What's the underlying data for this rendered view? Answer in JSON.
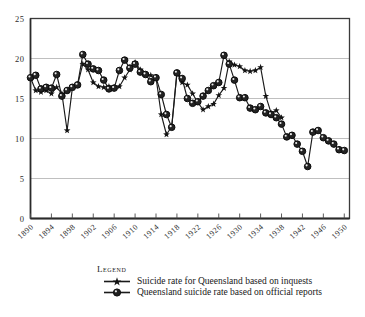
{
  "chart_data": {
    "type": "line",
    "title": "",
    "subtitle": "",
    "xlabel": "",
    "ylabel": "",
    "xlim": [
      1890,
      1951
    ],
    "ylim": [
      0,
      25
    ],
    "yticks": [
      0,
      5,
      10,
      15,
      20,
      25
    ],
    "ytick_labels": [
      "0",
      "5",
      "10",
      "15",
      "20",
      "25"
    ],
    "grid": "horizontal",
    "legend_position": "below-axes",
    "legend_title": "Legend",
    "x": [
      1890,
      1891,
      1892,
      1893,
      1894,
      1895,
      1896,
      1897,
      1898,
      1899,
      1900,
      1901,
      1902,
      1903,
      1904,
      1905,
      1906,
      1907,
      1908,
      1909,
      1910,
      1911,
      1912,
      1913,
      1914,
      1915,
      1916,
      1917,
      1918,
      1919,
      1920,
      1921,
      1922,
      1923,
      1924,
      1925,
      1926,
      1927,
      1928,
      1929,
      1930,
      1931,
      1932,
      1933,
      1934,
      1935,
      1936,
      1937,
      1938,
      1939,
      1940,
      1941,
      1942,
      1943,
      1944,
      1945,
      1946,
      1947,
      1948,
      1949,
      1950
    ],
    "xtick_labels": [
      "1890",
      "1894",
      "1898",
      "1902",
      "1906",
      "1910",
      "1914",
      "1918",
      "1922",
      "1926",
      "1930",
      "1934",
      "1938",
      "1942",
      "1946",
      "1950"
    ],
    "xtick_values": [
      1890,
      1894,
      1898,
      1902,
      1906,
      1910,
      1914,
      1918,
      1922,
      1926,
      1930,
      1934,
      1938,
      1942,
      1946,
      1950
    ],
    "series": [
      {
        "name": "Suicide rate for Queensland based on inquests",
        "marker": "star",
        "color": "#1a1a1a",
        "values": [
          17.6,
          16.0,
          15.8,
          16.0,
          15.6,
          16.4,
          15.6,
          11.0,
          16.3,
          16.7,
          19.3,
          18.6,
          17.0,
          16.5,
          16.4,
          16.5,
          16.4,
          16.5,
          17.6,
          18.6,
          19.5,
          18.6,
          18.0,
          17.9,
          17.6,
          13.0,
          10.5,
          11.5,
          18.2,
          17.0,
          16.7,
          15.6,
          14.5,
          13.6,
          14.0,
          14.3,
          15.4,
          16.3,
          19.6,
          19.2,
          19.0,
          18.5,
          18.4,
          18.5,
          18.9,
          15.3,
          13.2,
          13.5,
          12.6,
          null,
          null,
          null,
          null,
          null,
          null,
          null,
          null,
          null,
          null,
          null,
          null
        ]
      },
      {
        "name": "Queensland suicide rate based on official reports",
        "marker": "circle",
        "color": "#1a1a1a",
        "values": [
          17.6,
          17.9,
          16.2,
          16.4,
          16.3,
          18.0,
          15.3,
          16.0,
          16.4,
          16.7,
          20.5,
          19.3,
          18.7,
          18.5,
          17.3,
          16.2,
          16.3,
          18.5,
          19.8,
          18.8,
          19.3,
          18.3,
          18.0,
          17.1,
          17.6,
          15.5,
          13.0,
          11.4,
          18.2,
          17.5,
          15.0,
          14.4,
          14.6,
          15.3,
          16.0,
          16.6,
          17.0,
          20.4,
          19.3,
          17.3,
          15.1,
          15.1,
          13.8,
          13.6,
          14.0,
          13.2,
          13.0,
          12.6,
          11.8,
          10.2,
          10.4,
          9.3,
          8.4,
          6.5,
          10.8,
          11.0,
          10.1,
          9.7,
          9.3,
          8.6,
          8.5
        ]
      }
    ]
  },
  "legend": {
    "title": "Legend",
    "entries": [
      {
        "label": "Suicide rate for Queensland based on inquests",
        "marker": "star-marker"
      },
      {
        "label": "Queensland suicide rate based on official reports",
        "marker": "circle-marker"
      }
    ]
  },
  "axes": {
    "y_labels": [
      "25",
      "20",
      "15",
      "10",
      "5",
      "0"
    ],
    "x_labels": [
      "1890",
      "1894",
      "1898",
      "1902",
      "1906",
      "1910",
      "1914",
      "1918",
      "1922",
      "1926",
      "1930",
      "1934",
      "1938",
      "1942",
      "1946",
      "1950"
    ]
  },
  "colors": {
    "line": "#1a1a1a",
    "grid": "#b8b8b8",
    "axis": "#3a3a3a",
    "background": "#ffffff",
    "text": "#1a1a1a"
  }
}
